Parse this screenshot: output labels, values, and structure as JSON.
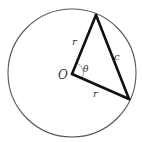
{
  "diagram": {
    "type": "geometry",
    "circle": {
      "cx": 72,
      "cy": 73,
      "r": 64,
      "stroke": "#555555"
    },
    "center_label": "O",
    "points": {
      "O": [
        72,
        74
      ],
      "A": [
        96,
        15
      ],
      "B": [
        129,
        99
      ]
    },
    "labels": {
      "radius_top": "r",
      "radius_bottom": "r",
      "chord": "c",
      "angle": "θ"
    },
    "colors": {
      "triangle_stroke": "#111111",
      "circle_stroke": "#555555",
      "arc_stroke": "#888888"
    }
  }
}
